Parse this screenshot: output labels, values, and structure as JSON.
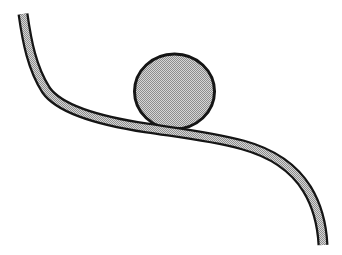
{
  "figure": {
    "name": "ball-on-curved-slope",
    "colors": {
      "background": "#ffffff",
      "outline": "#151515",
      "halftone_dark": "#8d8d8d",
      "halftone_light": "#d6d6d6",
      "fill_average": "#b3b3b3"
    },
    "elements": [
      {
        "name": "slope-curve",
        "shape": "thick curved band",
        "texture": "gray halftone dither between black edges",
        "path": "descends from top-left (23,14) through a flat middle near y=130 to bottom-right end (323,245)"
      },
      {
        "name": "ball",
        "shape": "ellipse",
        "texture": "gray halftone dither with black outline",
        "position": "resting on the slope, upper middle of the figure"
      }
    ]
  }
}
